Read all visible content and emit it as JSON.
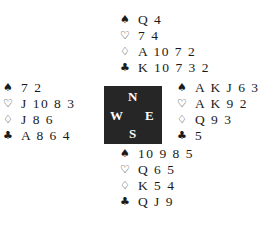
{
  "suits": {
    "spades": "♠",
    "hearts": "♡",
    "diamonds": "♢",
    "clubs": "♣"
  },
  "compass": {
    "north": "N",
    "south": "S",
    "east": "E",
    "west": "W",
    "background": "#262626"
  },
  "hands": {
    "north": {
      "spades": "Q 4",
      "hearts": "7 4",
      "diamonds": "A 10 7 2",
      "clubs": "K 10 7 3 2"
    },
    "west": {
      "spades": "7 2",
      "hearts": "J 10 8 3",
      "diamonds": "J 8 6",
      "clubs": "A 8 6 4"
    },
    "east": {
      "spades": "A K J 6 3",
      "hearts": "A K 9 2",
      "diamonds": "Q 9 3",
      "clubs": "5"
    },
    "south": {
      "spades": "10 9 8 5",
      "hearts": "Q 6 5",
      "diamonds": "K 5 4",
      "clubs": "Q J 9"
    }
  }
}
